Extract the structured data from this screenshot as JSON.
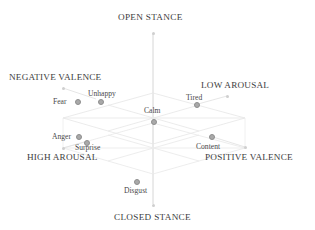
{
  "figure": {
    "type": "3d-scatter",
    "background_color": "#ffffff",
    "marker_color": "#a9a9a9",
    "grid_color": "#e2e2e2",
    "axis_color": "#d8d8d8",
    "text_color": "#3d3d3d"
  },
  "axes": {
    "vertical": {
      "top_label": "OPEN STANCE",
      "bottom_label": "CLOSED STANCE"
    },
    "corners": [
      {
        "label": "NEGATIVE VALENCE",
        "position": "upper-left"
      },
      {
        "label": "LOW AROUSAL",
        "position": "upper-right"
      },
      {
        "label": "HIGH AROUSAL",
        "position": "lower-left"
      },
      {
        "label": "POSITIVE VALENCE",
        "position": "lower-right"
      }
    ]
  },
  "chart_data": {
    "type": "scatter",
    "title": "",
    "xlabel": "Valence",
    "ylabel": "Arousal",
    "zlabel": "Stance",
    "axis_endpoint_labels": {
      "x_negative": "NEGATIVE VALENCE",
      "x_positive": "POSITIVE VALENCE",
      "y_high": "HIGH AROUSAL",
      "y_low": "LOW AROUSAL",
      "z_top": "OPEN STANCE",
      "z_bottom": "CLOSED STANCE"
    },
    "points": [
      {
        "label": "Fear",
        "px": 77,
        "py": 101,
        "lx": 53,
        "ly": 97,
        "anchor": "right"
      },
      {
        "label": "Unhappy",
        "px": 100,
        "py": 101,
        "lx": 88,
        "ly": 89,
        "anchor": "left"
      },
      {
        "label": "Tired",
        "px": 196,
        "py": 104,
        "lx": 186,
        "ly": 93,
        "anchor": "left"
      },
      {
        "label": "Calm",
        "px": 153,
        "py": 121,
        "lx": 144,
        "ly": 106,
        "anchor": "left"
      },
      {
        "label": "Anger",
        "px": 78,
        "py": 136,
        "lx": 52,
        "ly": 132,
        "anchor": "right"
      },
      {
        "label": "Surprise",
        "px": 86,
        "py": 142,
        "lx": 75,
        "ly": 143,
        "anchor": "left"
      },
      {
        "label": "Content",
        "px": 211,
        "py": 136,
        "lx": 196,
        "ly": 142,
        "anchor": "left"
      },
      {
        "label": "Disgust",
        "px": 136,
        "py": 181,
        "lx": 124,
        "ly": 186,
        "anchor": "left"
      }
    ],
    "axis_tip_markers": [
      {
        "x": 153,
        "y": 33
      },
      {
        "x": 153,
        "y": 205
      },
      {
        "x": 63,
        "y": 88
      },
      {
        "x": 227,
        "y": 96
      },
      {
        "x": 63,
        "y": 148
      },
      {
        "x": 245,
        "y": 147
      }
    ],
    "grid": true,
    "legend": "none"
  }
}
